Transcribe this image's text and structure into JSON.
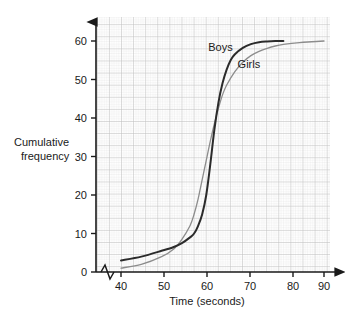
{
  "chart_data": {
    "type": "line",
    "title": "",
    "xlabel": "Time (seconds)",
    "ylabel": "Cumulative frequency",
    "ylabel_line1": "Cumulative",
    "ylabel_line2": "frequency",
    "xlim": [
      40,
      90
    ],
    "ylim": [
      0,
      62
    ],
    "x_ticks": [
      40,
      50,
      60,
      70,
      80,
      90
    ],
    "y_ticks": [
      0,
      10,
      20,
      30,
      40,
      50,
      60
    ],
    "grid": "graph-paper",
    "axis_break_x": true,
    "legend_position": "inline-annotation",
    "series": [
      {
        "name": "Boys",
        "color": "#2b2b2b",
        "width": 2.0,
        "x": [
          40,
          45,
          50,
          53,
          55,
          57,
          58,
          59,
          60,
          61,
          62,
          63,
          64,
          65,
          66,
          67,
          68,
          70,
          72,
          74,
          76,
          78,
          80
        ],
        "values": [
          3,
          4,
          5.5,
          6.5,
          7.5,
          9,
          10,
          12,
          15,
          20,
          28,
          37,
          44,
          49,
          52.5,
          55,
          56.5,
          58.2,
          59.2,
          59.7,
          59.9,
          60,
          60
        ]
      },
      {
        "name": "Girls",
        "color": "#8c8c8c",
        "width": 1.3,
        "x": [
          40,
          45,
          50,
          53,
          55,
          57,
          58,
          59,
          60,
          61,
          62,
          63,
          64,
          65,
          66,
          68,
          70,
          72,
          74,
          76,
          78,
          80,
          84,
          87,
          90
        ],
        "values": [
          1,
          2,
          4,
          6,
          8.5,
          12,
          15,
          19,
          24,
          29,
          34,
          38.5,
          42.5,
          46,
          48.5,
          52,
          54.5,
          56.2,
          57.3,
          58.1,
          58.7,
          59.1,
          59.6,
          59.8,
          60
        ]
      }
    ],
    "annotations": [
      {
        "text": "Boys",
        "x": 64.5,
        "y": 57.5
      },
      {
        "text": "Girls",
        "x": 71.5,
        "y": 53.0
      }
    ]
  },
  "ticks": {
    "x": [
      "40",
      "50",
      "60",
      "70",
      "80",
      "90"
    ],
    "y": [
      "0",
      "10",
      "20",
      "30",
      "40",
      "50",
      "60"
    ]
  }
}
